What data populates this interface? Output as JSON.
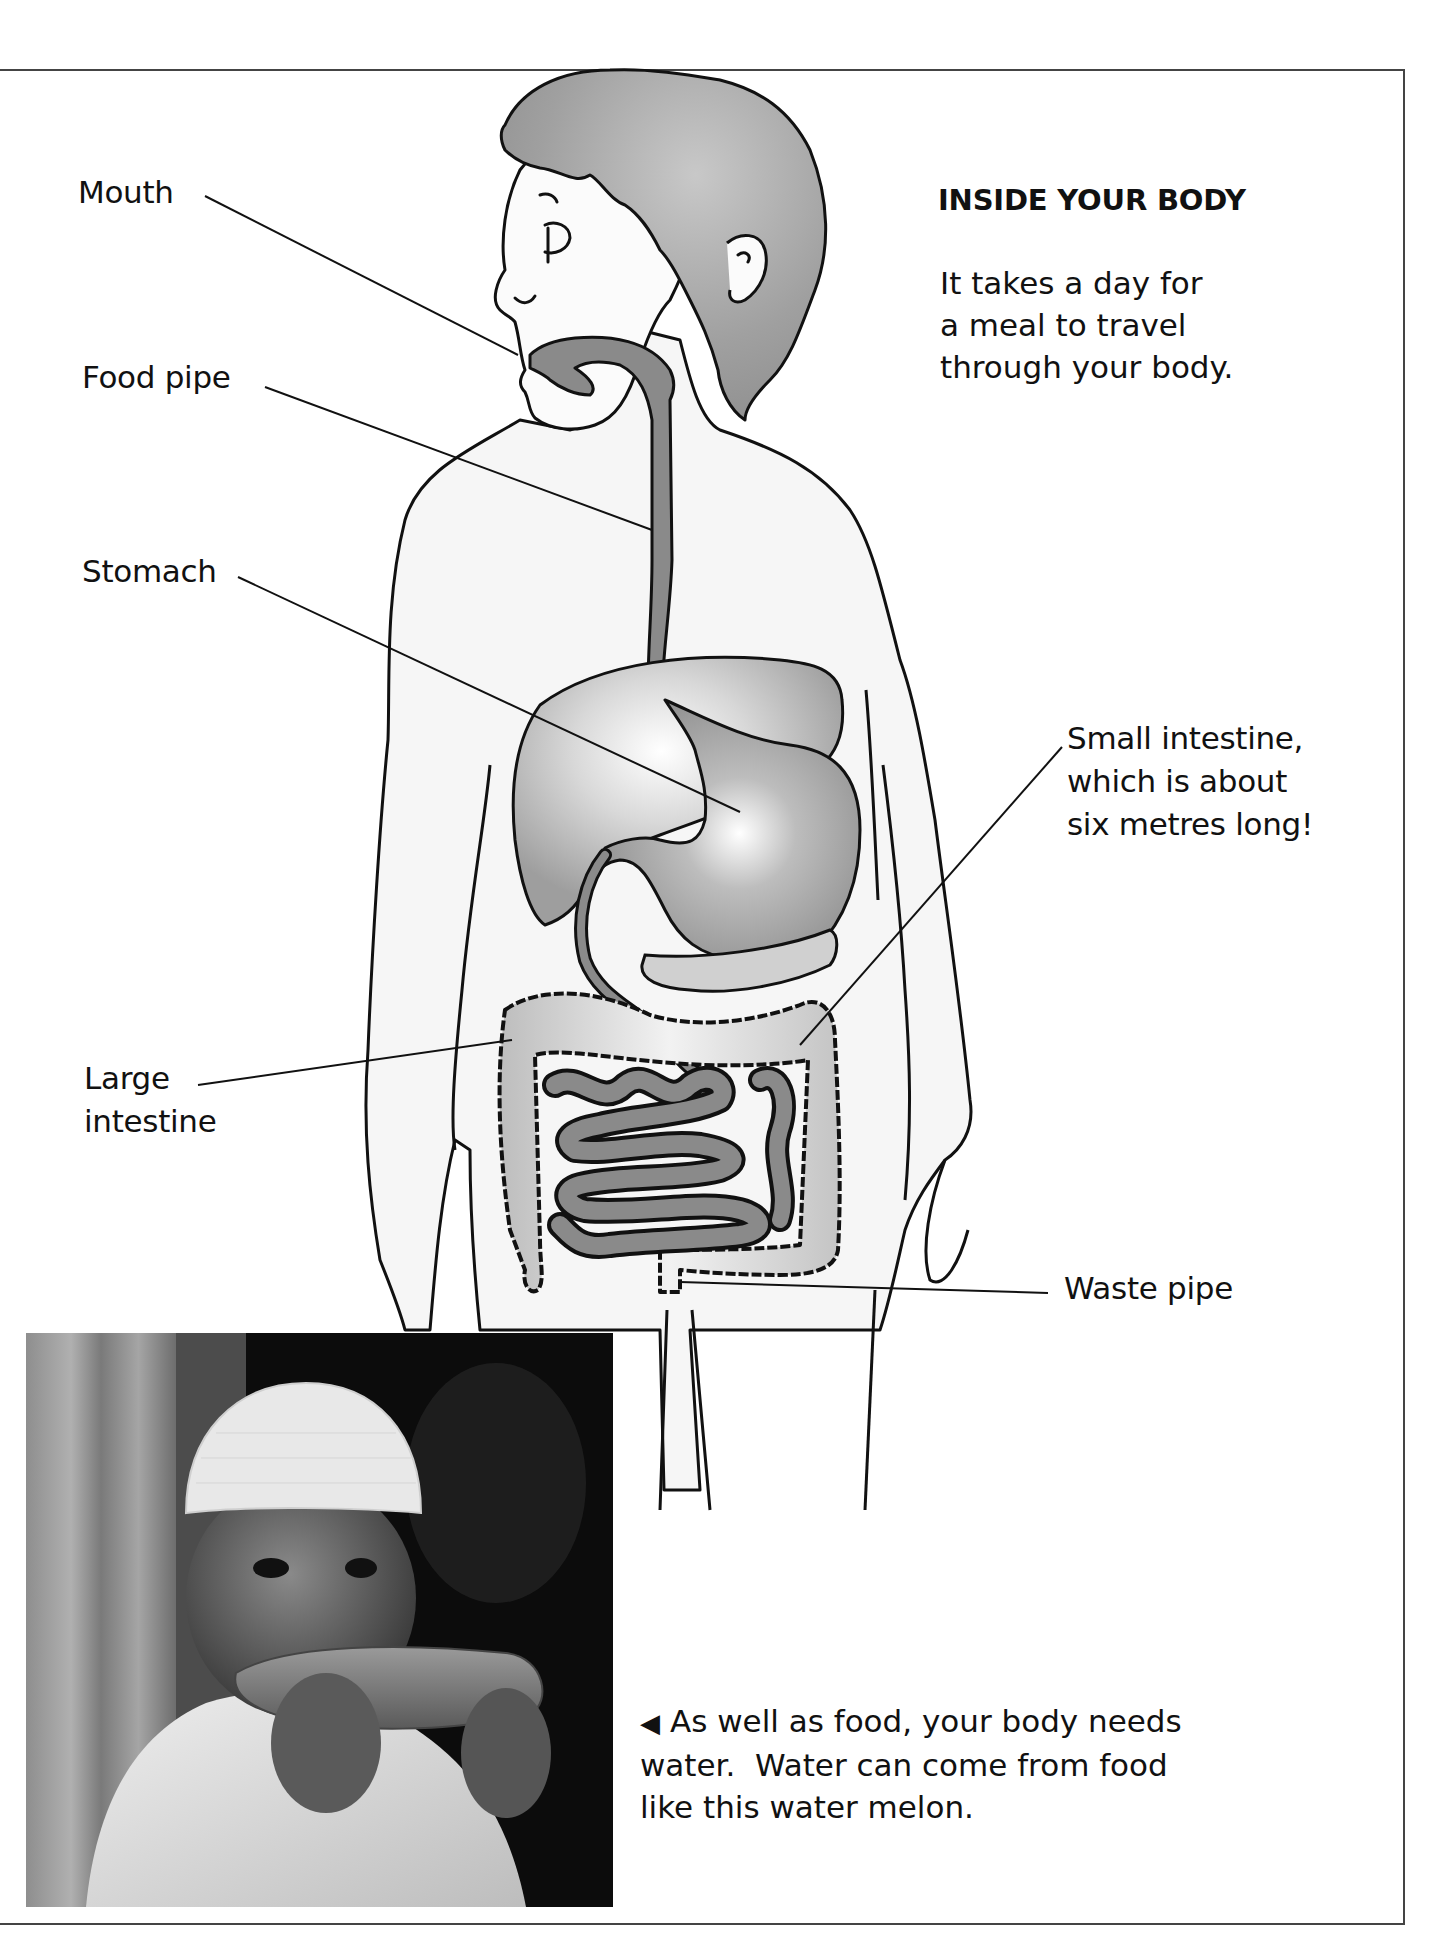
{
  "page": {
    "title": "INSIDE YOUR BODY",
    "intro_lines": [
      "It takes a day for",
      "a meal to travel",
      "through your body."
    ]
  },
  "diagram": {
    "labels": {
      "mouth": "Mouth",
      "food_pipe": "Food pipe",
      "stomach": "Stomach",
      "small_intestine": [
        "Small intestine,",
        "which is about",
        "six metres long!"
      ],
      "large_intestine": [
        "Large",
        "intestine"
      ],
      "waste_pipe": "Waste pipe"
    },
    "colors": {
      "organ_dark": "#8a8a8a",
      "organ_light": "#c9c9c9",
      "hair": "#9a9a9a",
      "outline": "#111111",
      "skin": "#f4f4f4"
    }
  },
  "photo": {
    "description": "Boy in white cap eating a slice of water melon",
    "caption_arrow": "◀",
    "caption_lines": [
      "As well as food, your body needs",
      "water.  Water can come from food",
      "like this water melon."
    ]
  }
}
